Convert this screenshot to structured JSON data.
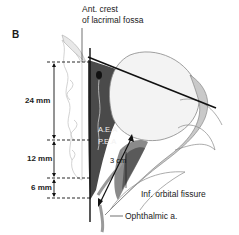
{
  "figure": {
    "panel_label": "B"
  },
  "labels": {
    "top": [
      "Ant. crest",
      "of lacrimal fossa"
    ],
    "aea": "A.E.A",
    "pea": "P.E.A",
    "distance_cm": "3 cm",
    "inf_orbital_fissure": "Inf. orbital fissure",
    "ophthalmic": "Ophthalmic a."
  },
  "measurements": [
    {
      "label": "24 mm",
      "from": "anterior lacrimal crest",
      "to": "A.E.A"
    },
    {
      "label": "12 mm",
      "from": "A.E.A",
      "to": "P.E.A"
    },
    {
      "label": "6 mm",
      "from": "P.E.A",
      "to": "optic canal"
    }
  ],
  "colors": {
    "wall": "#4a4a4a",
    "globe": "#f3f3f3",
    "line": "#111111",
    "bone_outline": "#bdbdbd"
  }
}
